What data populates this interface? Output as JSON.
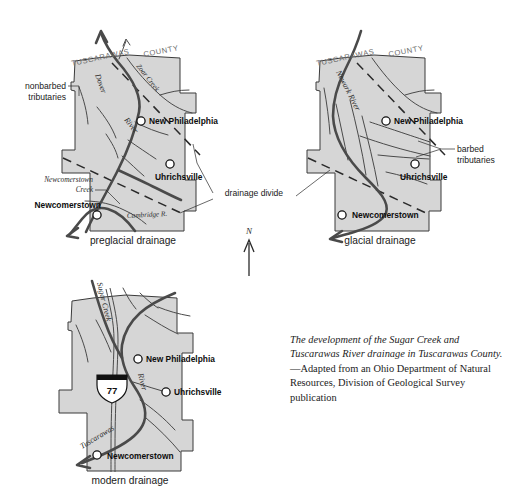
{
  "figure": {
    "title_caption": {
      "emphasis": "The development of the Sugar Creek and Tuscarawas River drainage in Tuscarawas County.",
      "source": " —Adapted from an Ohio Department of Natural Resources, Division of Geological Survey publication"
    },
    "north_arrow_label": "N",
    "shared_annotation": "drainage divide",
    "county_label_left": "TUSCARAWAS",
    "county_label_right": "COUNTY"
  },
  "panels": [
    {
      "id": "preglacial",
      "label": "preglacial drainage",
      "cities": [
        {
          "name": "New Philadelphia"
        },
        {
          "name": "Uhrichsville"
        },
        {
          "name": "Newcomerstown"
        }
      ],
      "waterways": [
        {
          "name": "Dover"
        },
        {
          "name": "River"
        },
        {
          "name": "Zoar Creek"
        },
        {
          "name": "Cambridge R."
        }
      ],
      "annotations": [
        {
          "name": "nonbarbed tributaries",
          "line1": "nonbarbed",
          "line2": "tributaries"
        },
        {
          "name": "Newcomerstown Creek",
          "line1": "Newcomerstown",
          "line2": "Creek"
        }
      ]
    },
    {
      "id": "glacial",
      "label": "glacial drainage",
      "cities": [
        {
          "name": "New Philadelphia"
        },
        {
          "name": "Uhrichsville"
        },
        {
          "name": "Newcomerstown"
        }
      ],
      "waterways": [
        {
          "name": "Newark River"
        }
      ],
      "annotations": [
        {
          "name": "barbed tributaries",
          "line1": "barbed",
          "line2": "tributaries"
        }
      ]
    },
    {
      "id": "modern",
      "label": "modern drainage",
      "cities": [
        {
          "name": "New Philadelphia"
        },
        {
          "name": "Uhrichsville"
        },
        {
          "name": "Newcomerstown"
        }
      ],
      "waterways": [
        {
          "name": "Sugar Creek"
        },
        {
          "name": "River"
        },
        {
          "name": "Tuscarawas"
        }
      ],
      "highway": {
        "shield_number": "77",
        "system": "interstate"
      }
    }
  ],
  "colors": {
    "county_fill": "#d6d6d6",
    "county_outline": "#3b3b3b",
    "river": "#4a4a4a",
    "divide": "#2a2a2a",
    "text": "#111111",
    "county_text": "#6d6d6d"
  }
}
